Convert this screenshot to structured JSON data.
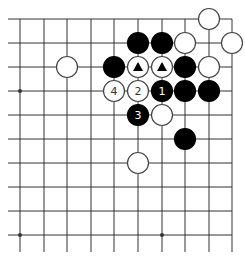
{
  "diagram": {
    "type": "go-board-fragment",
    "grid": {
      "columns_x": [
        20,
        44,
        67,
        91,
        114,
        138,
        162,
        185,
        209,
        232
      ],
      "rows_y": [
        19,
        43,
        67,
        91,
        115,
        139,
        163,
        187,
        211,
        235
      ],
      "line_left_x": 8,
      "line_right_x": 232,
      "line_top_y": 19,
      "line_bottom_y": 252,
      "line_color": "#333333"
    },
    "star_points": [
      {
        "col": 0,
        "row": 3
      },
      {
        "col": 0,
        "row": 9
      },
      {
        "col": 6,
        "row": 9
      }
    ],
    "stones": [
      {
        "color": "white",
        "col": 8,
        "row": 0,
        "label": "",
        "marker": ""
      },
      {
        "color": "black",
        "col": 5,
        "row": 1,
        "label": "",
        "marker": ""
      },
      {
        "color": "black",
        "col": 6,
        "row": 1,
        "label": "",
        "marker": ""
      },
      {
        "color": "white",
        "col": 7,
        "row": 1,
        "label": "",
        "marker": ""
      },
      {
        "color": "white",
        "col": 9,
        "row": 1,
        "label": "",
        "marker": ""
      },
      {
        "color": "white",
        "col": 2,
        "row": 2,
        "label": "",
        "marker": ""
      },
      {
        "color": "black",
        "col": 4,
        "row": 2,
        "label": "",
        "marker": ""
      },
      {
        "color": "white",
        "col": 5,
        "row": 2,
        "label": "",
        "marker": "triangle"
      },
      {
        "color": "white",
        "col": 6,
        "row": 2,
        "label": "",
        "marker": "triangle"
      },
      {
        "color": "black",
        "col": 7,
        "row": 2,
        "label": "",
        "marker": ""
      },
      {
        "color": "white",
        "col": 8,
        "row": 2,
        "label": "",
        "marker": ""
      },
      {
        "color": "white",
        "col": 4,
        "row": 3,
        "label": "4",
        "marker": ""
      },
      {
        "color": "white",
        "col": 5,
        "row": 3,
        "label": "2",
        "marker": ""
      },
      {
        "color": "black",
        "col": 6,
        "row": 3,
        "label": "1",
        "marker": ""
      },
      {
        "color": "black",
        "col": 7,
        "row": 3,
        "label": "",
        "marker": ""
      },
      {
        "color": "black",
        "col": 8,
        "row": 3,
        "label": "",
        "marker": ""
      },
      {
        "color": "black",
        "col": 5,
        "row": 4,
        "label": "3",
        "marker": ""
      },
      {
        "color": "white",
        "col": 6,
        "row": 4,
        "label": "",
        "marker": ""
      },
      {
        "color": "black",
        "col": 7,
        "row": 5,
        "label": "",
        "marker": ""
      },
      {
        "color": "white",
        "col": 5,
        "row": 6,
        "label": "",
        "marker": ""
      }
    ],
    "colors": {
      "black_stone": "#000000",
      "white_stone": "#ffffff",
      "stone_outline": "#444444",
      "label_on_black": "#ffffff",
      "label_on_white": "#333333"
    }
  }
}
